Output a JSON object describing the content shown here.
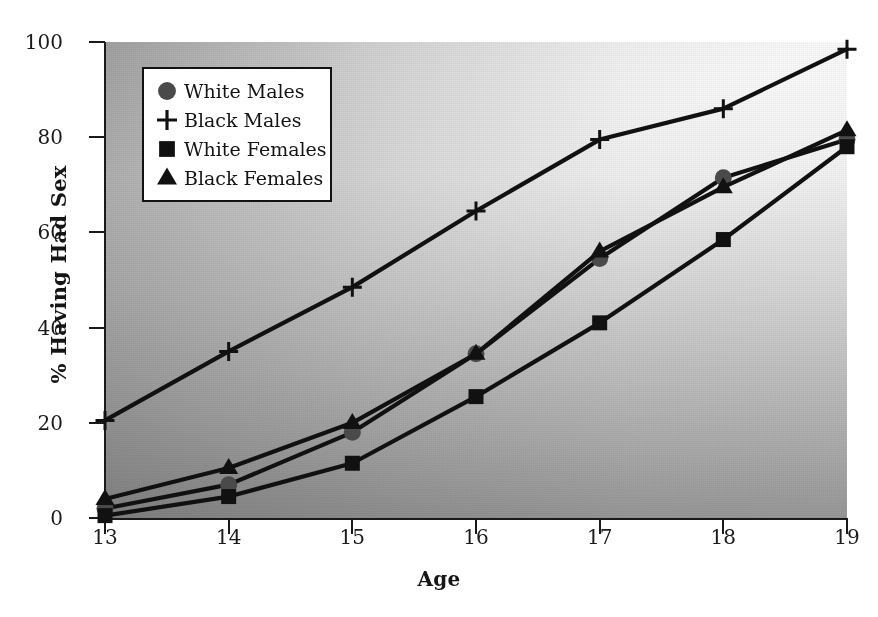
{
  "chart_data": {
    "type": "line",
    "title": "",
    "xlabel": "Age",
    "ylabel": "% Having Had Sex",
    "x": [
      13,
      14,
      15,
      16,
      17,
      18,
      19
    ],
    "categories": [
      "13",
      "14",
      "15",
      "16",
      "17",
      "18",
      "19"
    ],
    "xlim": [
      13,
      19
    ],
    "ylim": [
      0,
      100
    ],
    "yticks": [
      0,
      20,
      40,
      60,
      80,
      100
    ],
    "ytick_labels": [
      "0",
      "20",
      "40",
      "60",
      "80",
      "100"
    ],
    "xticks": [
      13,
      14,
      15,
      16,
      17,
      18,
      19
    ],
    "xtick_labels": [
      "13",
      "14",
      "15",
      "16",
      "17",
      "18",
      "19"
    ],
    "grid": false,
    "legend_position": "upper left",
    "series": [
      {
        "name": "White Males",
        "marker": "circle",
        "color": "#4a4a4a",
        "values": [
          2,
          7,
          18,
          34.5,
          54.5,
          71.5,
          79.5
        ]
      },
      {
        "name": "Black Males",
        "marker": "plus",
        "color": "#111111",
        "values": [
          20.5,
          35,
          48.5,
          64.5,
          79.5,
          86,
          98.5
        ]
      },
      {
        "name": "White Females",
        "marker": "square",
        "color": "#111111",
        "values": [
          0.5,
          4.5,
          11.5,
          25.5,
          41,
          58.5,
          78
        ]
      },
      {
        "name": "Black Females",
        "marker": "triangle",
        "color": "#111111",
        "values": [
          4,
          10.5,
          20,
          34.5,
          56,
          69.5,
          81.5
        ]
      }
    ]
  },
  "legend": {
    "items": [
      {
        "label": "White Males",
        "marker": "circle"
      },
      {
        "label": "Black Males",
        "marker": "plus"
      },
      {
        "label": "White Females",
        "marker": "square"
      },
      {
        "label": "Black Females",
        "marker": "triangle"
      }
    ]
  },
  "axes": {
    "ylabel": "% Having Had Sex",
    "xlabel": "Age"
  },
  "footnote": ""
}
